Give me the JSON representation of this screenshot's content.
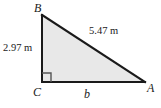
{
  "figure": {
    "kind": "right-triangle-diagram",
    "background_color": "#ffffff",
    "fill_color": "#e8e8e8",
    "stroke_color": "#1a1a1a",
    "vertices": {
      "B": {
        "label": "B",
        "x": 42,
        "y": 15
      },
      "C": {
        "label": "C",
        "x": 42,
        "y": 82
      },
      "A": {
        "label": "A",
        "x": 145,
        "y": 82
      }
    },
    "right_angle": {
      "at_vertex": "C",
      "marker": "square",
      "size": 8
    },
    "sides": {
      "vertical_leg": {
        "name": "leg-CB",
        "label": "2.97 m",
        "value": 2.97,
        "unit": "m"
      },
      "hypotenuse": {
        "name": "hypotenuse-BA",
        "label": "5.47 m",
        "value": 5.47,
        "unit": "m"
      },
      "horizontal_leg": {
        "name": "leg-CA",
        "label": "b",
        "value": null,
        "unit": "m"
      }
    }
  }
}
